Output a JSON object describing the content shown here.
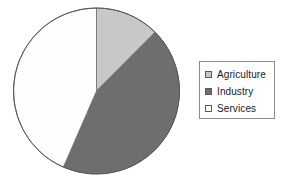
{
  "chart_data": {
    "type": "pie",
    "title": "",
    "subtitle": "",
    "xlabel": "",
    "ylabel": "",
    "grid": false,
    "legend_position": "right",
    "start_angle_deg": 0,
    "direction": "clockwise",
    "categories": [
      "Agriculture",
      "Industry",
      "Services"
    ],
    "values": [
      12.5,
      44.0,
      43.5
    ],
    "units": "percent",
    "slices": [
      {
        "label": "Agriculture",
        "value": 12.5,
        "color": "#c8c8c8",
        "start_deg": 0,
        "end_deg": 45
      },
      {
        "label": "Industry",
        "value": 44.0,
        "color": "#6e6e6e",
        "start_deg": 45,
        "end_deg": 203.5
      },
      {
        "label": "Services",
        "value": 43.5,
        "color": "#fdfdfd",
        "start_deg": 203.5,
        "end_deg": 360
      }
    ]
  },
  "pie": {
    "center_x": 96.5,
    "center_y": 91,
    "radius": 83,
    "outline_color": "#555555"
  },
  "legend": {
    "border_color": "#8a8a8a",
    "items": [
      {
        "label": "Agriculture",
        "swatch_color": "#c8c8c8",
        "swatch_name": "legend-swatch-agriculture"
      },
      {
        "label": "Industry",
        "swatch_color": "#6e6e6e",
        "swatch_name": "legend-swatch-industry"
      },
      {
        "label": "Services",
        "swatch_color": "#ffffff",
        "swatch_name": "legend-swatch-services"
      }
    ]
  }
}
